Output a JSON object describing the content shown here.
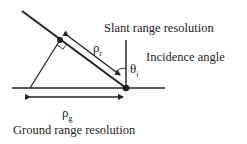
{
  "diagram": {
    "labels": {
      "slant_range": "Slant range resolution",
      "incidence": "Incidence angle",
      "ground_range": "Ground range resolution",
      "rho_r": "ρ",
      "rho_r_sub": "r",
      "rho_g": "ρ",
      "rho_g_sub": "g",
      "theta": "θ",
      "theta_sub": "i"
    },
    "colors": {
      "line": "#222222",
      "background": "#ffffff"
    }
  }
}
